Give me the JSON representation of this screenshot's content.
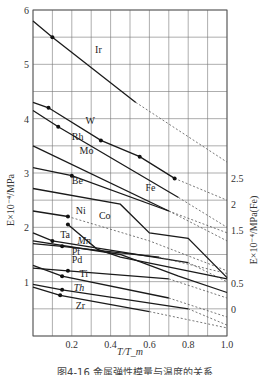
{
  "chart_data": {
    "type": "line",
    "title": "",
    "caption": "图4-16 金属弹性模量与温度的关系",
    "xlabel": "T/T_m",
    "ylabel_left": "E×10⁻⁴/MPa",
    "ylabel_right": "E×10⁻⁴/MPa(Fe)",
    "xlim": [
      0,
      1.0
    ],
    "ylim_left": [
      0,
      6
    ],
    "ylim_right_ticks": [
      "2.5",
      "2",
      "1.5",
      "0.5",
      "0"
    ],
    "x_ticks": [
      "0.2",
      "0.4",
      "0.6",
      "0.8",
      "1.0"
    ],
    "y_ticks_left": [
      "1",
      "2",
      "3",
      "4",
      "5",
      "6"
    ],
    "grid": true,
    "legend": "inline labels",
    "series": [
      {
        "name": "Ir",
        "x": [
          0,
          0.1,
          0.53,
          1.0
        ],
        "y": [
          5.8,
          5.5,
          4.3,
          3.2
        ],
        "solid_until": 0.53,
        "marker_x": [
          0.1
        ]
      },
      {
        "name": "W",
        "x": [
          0,
          0.08,
          0.35,
          0.55,
          0.73,
          1.0
        ],
        "y": [
          4.3,
          4.2,
          3.6,
          3.3,
          2.9,
          2.5
        ],
        "solid_until": 0.73,
        "marker_x": [
          0.08,
          0.35,
          0.55,
          0.73
        ]
      },
      {
        "name": "Rh",
        "x": [
          0,
          0.13,
          0.75,
          1.0
        ],
        "y": [
          4.15,
          3.85,
          2.55,
          2.0
        ],
        "solid_until": 0.75,
        "marker_x": [
          0.13
        ]
      },
      {
        "name": "Mo",
        "x": [
          0,
          0.7,
          1.0
        ],
        "y": [
          3.5,
          2.3,
          1.75
        ],
        "solid_until": 0.7
      },
      {
        "name": "Be",
        "x": [
          0,
          0.2,
          0.7,
          1.0
        ],
        "y": [
          3.1,
          2.95,
          2.3,
          1.9
        ],
        "solid_until": 0.7,
        "marker_x": [
          0.2
        ]
      },
      {
        "name": "Ni",
        "x": [
          0,
          0.18,
          0.6,
          1.0
        ],
        "y": [
          2.3,
          2.2,
          1.75,
          1.2
        ],
        "solid_until": 0.18,
        "marker_x": [
          0.18
        ]
      },
      {
        "name": "Co",
        "x": [
          0.18,
          0.33,
          0.45,
          1.0
        ],
        "y": [
          2.05,
          1.6,
          1.45,
          1.05
        ],
        "marker_x": [
          0.18
        ]
      },
      {
        "name": "Fe",
        "x": [
          0,
          0.45,
          0.6,
          0.8,
          1.0
        ],
        "y": [
          2.3,
          2.0,
          1.45,
          1.35,
          0.6
        ],
        "axis": "right"
      },
      {
        "name": "Ta",
        "x": [
          0,
          0.1,
          0.8,
          1.0
        ],
        "y": [
          1.9,
          1.75,
          1.35,
          1.0
        ],
        "solid_until": 0.8,
        "marker_x": [
          0.1
        ]
      },
      {
        "name": "Mn",
        "x": [
          0,
          0.45,
          0.75,
          1.0
        ],
        "y": [
          1.75,
          1.5,
          1.1,
          0.8
        ]
      },
      {
        "name": "Pt",
        "x": [
          0,
          0.15,
          0.65,
          1.0
        ],
        "y": [
          1.7,
          1.65,
          1.45,
          1.15
        ],
        "solid_until": 0.65,
        "marker_x": [
          0.15
        ]
      },
      {
        "name": "Pd",
        "x": [
          0,
          0.18,
          0.7,
          1.0
        ],
        "y": [
          1.25,
          1.2,
          1.05,
          0.7
        ],
        "solid_until": 0.7,
        "marker_x": [
          0.18
        ]
      },
      {
        "name": "Ti",
        "x": [
          0,
          0.15,
          0.7,
          1.0
        ],
        "y": [
          1.3,
          1.1,
          0.7,
          0.35
        ],
        "solid_until": 0.7,
        "marker_x": [
          0.15
        ]
      },
      {
        "name": "Th",
        "x": [
          0,
          0.15,
          0.8,
          1.0
        ],
        "y": [
          0.95,
          0.85,
          0.5,
          0.2
        ],
        "solid_until": 0.8,
        "marker_x": [
          0.15
        ]
      },
      {
        "name": "Zr",
        "x": [
          0,
          0.14,
          0.6,
          1.0
        ],
        "y": [
          0.9,
          0.75,
          0.45,
          0.15
        ],
        "solid_until": 0.6,
        "marker_x": [
          0.14
        ]
      }
    ]
  }
}
